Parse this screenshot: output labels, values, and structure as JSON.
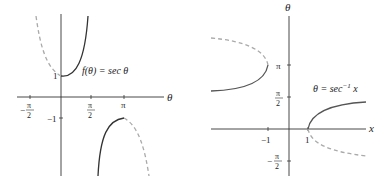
{
  "figures": [
    {
      "id": "sec-graph",
      "equation": "f(θ) = sec θ",
      "axis_labels": {
        "horizontal": "θ"
      },
      "x_ticks": [
        {
          "num": "π",
          "den": "2",
          "sign": "−",
          "value": -1.5708
        },
        {
          "num": "π",
          "den": "2",
          "sign": "",
          "value": 1.5708
        },
        {
          "label": "π",
          "value": 3.1416
        }
      ],
      "y_ticks": [
        {
          "label": "1",
          "value": 1
        },
        {
          "label": "−1",
          "value": -1
        }
      ],
      "solid_branches": "[0, π/2) and (π/2, π]",
      "dashed_branches": "(−π/2, 0) and (π, 3π/2)"
    },
    {
      "id": "arcsec-graph",
      "equation_lhs": "θ = sec",
      "equation_sup": "−1",
      "equation_rhs": " x",
      "axis_labels": {
        "horizontal": "x",
        "vertical": "θ"
      },
      "x_ticks": [
        {
          "label": "−1",
          "value": -1
        },
        {
          "label": "1",
          "value": 1
        }
      ],
      "y_ticks": [
        {
          "label": "π",
          "value": 3.1416
        },
        {
          "num": "π",
          "den": "2",
          "sign": "",
          "value": 1.5708
        },
        {
          "num": "π",
          "den": "2",
          "sign": "−",
          "value": -1.5708
        }
      ]
    }
  ],
  "colors": {
    "axis": "#333333",
    "solid_curve": "#333333",
    "dashed_curve": "#aaaaaa"
  }
}
